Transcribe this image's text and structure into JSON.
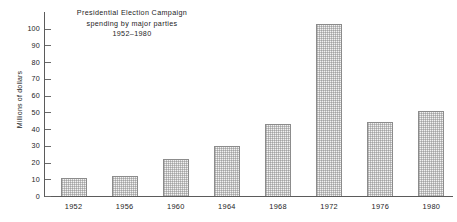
{
  "chart_data": {
    "type": "bar",
    "title": "Presidential Election Campaign spending by major parties 1952–1980",
    "title_lines": [
      "Presidential  Election  Campaign",
      "spending  by  major  parties",
      "1952–1980"
    ],
    "xlabel": "",
    "ylabel": "Millions of dollars",
    "categories": [
      "1952",
      "1956",
      "1960",
      "1964",
      "1968",
      "1972",
      "1976",
      "1980"
    ],
    "values": [
      11,
      12,
      22,
      30,
      43,
      103,
      44,
      51
    ],
    "ylim": [
      0,
      110
    ],
    "y_ticks": [
      0,
      10,
      20,
      30,
      40,
      50,
      60,
      70,
      80,
      90,
      100
    ],
    "y_tick_labels": [
      "0",
      "10",
      "20",
      "30",
      "40",
      "50",
      "60",
      "70",
      "80",
      "90",
      "100"
    ],
    "grid": false,
    "legend": null,
    "bar_fill_color": "#f2f2f2",
    "bar_edge_color": "#8c8c8c",
    "axis_color": "#5b5b5b",
    "text_color": "#1d1d1d"
  }
}
